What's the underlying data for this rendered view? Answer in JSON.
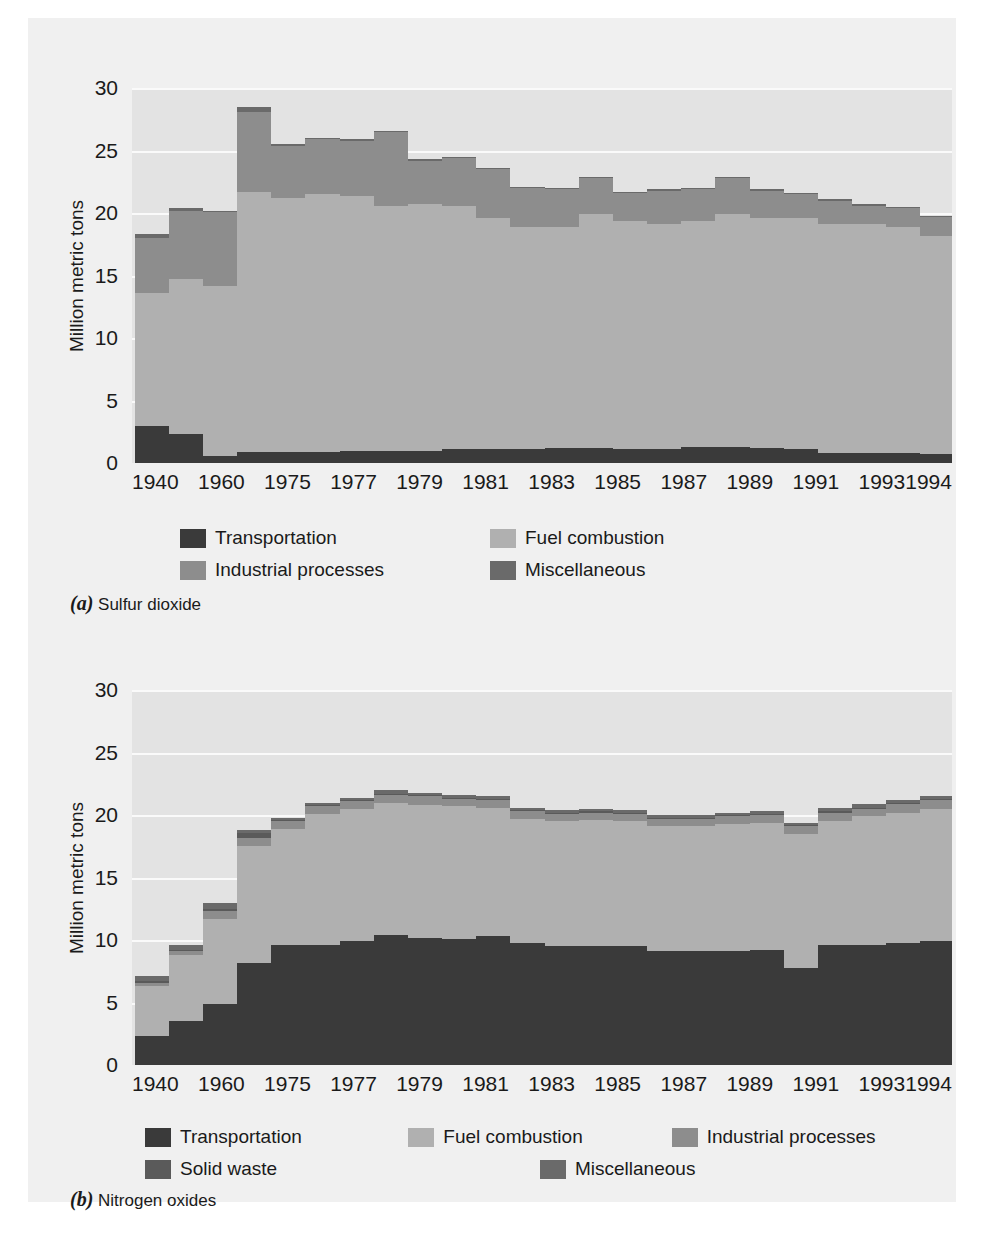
{
  "figure_colors": {
    "card_background": "#f0f0f0",
    "plot_background": "#e3e3e3",
    "gridline": "#fafafa",
    "transportation": "#3a3a3a",
    "fuel_combustion": "#b0b0b0",
    "industrial_processes": "#8d8d8d",
    "solid_waste": "#5a5a5a",
    "miscellaneous": "#6a6a6a",
    "text": "#1a1a1a"
  },
  "panel_a": {
    "caption_letter": "(a)",
    "caption_text": "Sulfur dioxide",
    "legend": [
      {
        "label": "Transportation",
        "color": "#3a3a3a"
      },
      {
        "label": "Fuel combustion",
        "color": "#b0b0b0"
      },
      {
        "label": "Industrial processes",
        "color": "#8d8d8d"
      },
      {
        "label": "Miscellaneous",
        "color": "#6a6a6a"
      }
    ]
  },
  "panel_b": {
    "caption_letter": "(b)",
    "caption_text": "Nitrogen oxides",
    "legend": [
      {
        "label": "Transportation",
        "color": "#3a3a3a"
      },
      {
        "label": "Fuel combustion",
        "color": "#b0b0b0"
      },
      {
        "label": "Industrial processes",
        "color": "#8d8d8d"
      },
      {
        "label": "Solid waste",
        "color": "#5a5a5a"
      },
      {
        "label": "Miscellaneous",
        "color": "#6a6a6a"
      }
    ]
  },
  "chart_data": [
    {
      "type": "bar",
      "subtype": "stacked",
      "id": "sulfur-dioxide",
      "title": "Sulfur dioxide",
      "panel_label": "(a)",
      "xlabel": "",
      "ylabel": "Million metric tons",
      "ylim": [
        0,
        30
      ],
      "yticks": [
        0,
        5,
        10,
        15,
        20,
        25,
        30
      ],
      "grid": true,
      "legend_position": "below-plot",
      "categories": [
        "1940",
        "1950",
        "1960",
        "1970",
        "1975",
        "1976",
        "1977",
        "1978",
        "1979",
        "1980",
        "1981",
        "1982",
        "1983",
        "1984",
        "1985",
        "1986",
        "1987",
        "1988",
        "1989",
        "1990",
        "1991",
        "1992",
        "1993",
        "1994"
      ],
      "tick_labels": [
        "1940",
        "",
        "1960",
        "",
        "1975",
        "",
        "1977",
        "",
        "1979",
        "",
        "1981",
        "",
        "1983",
        "",
        "1985",
        "",
        "1987",
        "",
        "1989",
        "",
        "1991",
        "",
        "1993",
        "1994"
      ],
      "series": [
        {
          "name": "Transportation",
          "color": "#3a3a3a",
          "values": [
            3.0,
            2.3,
            0.6,
            0.9,
            0.9,
            0.9,
            1.0,
            1.0,
            1.0,
            1.1,
            1.1,
            1.1,
            1.2,
            1.2,
            1.1,
            1.1,
            1.3,
            1.3,
            1.2,
            1.1,
            0.8,
            0.8,
            0.8,
            0.7
          ]
        },
        {
          "name": "Fuel combustion",
          "color": "#b0b0b0",
          "values": [
            10.6,
            12.4,
            13.6,
            20.8,
            20.3,
            20.6,
            20.4,
            19.6,
            19.7,
            19.5,
            18.5,
            17.8,
            17.7,
            18.7,
            18.3,
            18.0,
            18.1,
            18.6,
            18.4,
            18.5,
            18.3,
            18.3,
            18.1,
            17.5,
            17.0
          ]
        },
        {
          "name": "Industrial processes",
          "color": "#8d8d8d",
          "values": [
            4.4,
            5.5,
            5.9,
            6.4,
            4.2,
            4.4,
            4.4,
            5.9,
            3.5,
            3.8,
            3.9,
            3.1,
            3.0,
            2.9,
            2.2,
            2.7,
            2.5,
            2.9,
            2.2,
            1.9,
            1.9,
            1.5,
            1.5,
            1.5
          ]
        },
        {
          "name": "Miscellaneous",
          "color": "#6a6a6a",
          "values": [
            0.3,
            0.2,
            0.1,
            0.4,
            0.1,
            0.1,
            0.1,
            0.1,
            0.1,
            0.1,
            0.1,
            0.1,
            0.1,
            0.1,
            0.1,
            0.1,
            0.1,
            0.1,
            0.1,
            0.1,
            0.1,
            0.1,
            0.1,
            0.1
          ]
        }
      ],
      "totals": [
        18.3,
        20.4,
        20.2,
        28.5,
        25.7,
        25.9,
        26.7,
        24.4,
        24.8,
        23.6,
        22.6,
        21.8,
        22.2,
        22.2,
        21.2,
        21.1,
        20.5,
        21.0,
        21.5,
        20.5,
        20.4,
        20.0,
        19.6,
        19.3
      ]
    },
    {
      "type": "bar",
      "subtype": "stacked",
      "id": "nitrogen-oxides",
      "title": "Nitrogen oxides",
      "panel_label": "(b)",
      "xlabel": "",
      "ylabel": "Million metric tons",
      "ylim": [
        0,
        30
      ],
      "yticks": [
        0,
        5,
        10,
        15,
        20,
        25,
        30
      ],
      "grid": true,
      "legend_position": "below-plot",
      "categories": [
        "1940",
        "1950",
        "1960",
        "1970",
        "1975",
        "1976",
        "1977",
        "1978",
        "1979",
        "1980",
        "1981",
        "1982",
        "1983",
        "1984",
        "1985",
        "1986",
        "1987",
        "1988",
        "1989",
        "1990",
        "1991",
        "1992",
        "1993",
        "1994"
      ],
      "tick_labels": [
        "1940",
        "",
        "1960",
        "",
        "1975",
        "",
        "1977",
        "",
        "1979",
        "",
        "1981",
        "",
        "1983",
        "",
        "1985",
        "",
        "1987",
        "",
        "1989",
        "",
        "1991",
        "",
        "1993",
        "1994"
      ],
      "series": [
        {
          "name": "Transportation",
          "color": "#3a3a3a",
          "values": [
            2.3,
            3.5,
            4.9,
            8.2,
            9.6,
            9.6,
            9.9,
            10.4,
            10.2,
            10.1,
            10.3,
            9.8,
            9.5,
            9.5,
            9.5,
            9.1,
            9.1,
            9.1,
            9.2,
            7.8,
            9.6,
            9.6,
            9.8,
            9.9
          ]
        },
        {
          "name": "Fuel combustion",
          "color": "#b0b0b0",
          "values": [
            4.0,
            5.3,
            6.8,
            9.3,
            9.3,
            10.5,
            10.6,
            10.6,
            10.6,
            10.6,
            10.3,
            9.9,
            10.0,
            10.1,
            10.0,
            10.0,
            10.0,
            10.2,
            10.2,
            10.7,
            9.9,
            10.3,
            10.4,
            10.6
          ]
        },
        {
          "name": "Industrial processes",
          "color": "#8d8d8d",
          "values": [
            0.3,
            0.3,
            0.6,
            0.7,
            0.6,
            0.6,
            0.6,
            0.6,
            0.7,
            0.6,
            0.6,
            0.6,
            0.6,
            0.6,
            0.6,
            0.6,
            0.6,
            0.6,
            0.6,
            0.6,
            0.7,
            0.6,
            0.7,
            0.7
          ]
        },
        {
          "name": "Solid waste",
          "color": "#5a5a5a",
          "values": [
            0.1,
            0.1,
            0.2,
            0.4,
            0.1,
            0.1,
            0.1,
            0.1,
            0.1,
            0.1,
            0.1,
            0.1,
            0.1,
            0.1,
            0.1,
            0.1,
            0.1,
            0.1,
            0.1,
            0.1,
            0.1,
            0.1,
            0.1,
            0.1
          ]
        },
        {
          "name": "Miscellaneous",
          "color": "#6a6a6a",
          "values": [
            0.4,
            0.4,
            0.5,
            0.2,
            0.2,
            0.2,
            0.2,
            0.3,
            0.2,
            0.2,
            0.2,
            0.2,
            0.2,
            0.2,
            0.2,
            0.2,
            0.2,
            0.2,
            0.2,
            0.2,
            0.3,
            0.3,
            0.2,
            0.2
          ]
        }
      ],
      "totals": [
        7.1,
        9.6,
        13.0,
        18.8,
        19.8,
        21.0,
        21.4,
        22.0,
        21.8,
        21.6,
        21.5,
        20.6,
        20.4,
        20.5,
        20.4,
        20.0,
        20.0,
        20.2,
        20.3,
        19.4,
        20.6,
        20.9,
        21.2,
        21.5
      ]
    }
  ]
}
